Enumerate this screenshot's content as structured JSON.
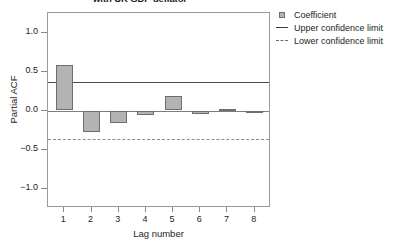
{
  "chart_data": {
    "type": "bar",
    "title": "with UK GDP deflator",
    "xlabel": "Lag number",
    "ylabel": "Partial ACF",
    "categories": [
      "1",
      "2",
      "3",
      "4",
      "5",
      "6",
      "7",
      "8"
    ],
    "values": [
      0.58,
      -0.27,
      -0.16,
      -0.06,
      0.18,
      -0.04,
      0.02,
      -0.01
    ],
    "series": [
      {
        "name": "Coefficient",
        "values": [
          0.58,
          -0.27,
          -0.16,
          -0.06,
          0.18,
          -0.04,
          0.02,
          -0.01
        ]
      }
    ],
    "ylim": [
      -1.25,
      1.25
    ],
    "yticks": [
      1.0,
      0.5,
      0.0,
      -0.5,
      -1.0
    ],
    "ytick_labels": [
      "1.0",
      "0.5",
      "0.0",
      "−0.5",
      "−1.0"
    ],
    "xlim": [
      0.4,
      8.6
    ],
    "upper_confidence_limit": 0.37,
    "lower_confidence_limit": -0.37,
    "grid": false,
    "legend_position": "top-right",
    "colors": {
      "bar_fill": "#b3b3b3",
      "bar_stroke": "#6e6e6e",
      "upper_limit_line": "#4a4a4a",
      "lower_limit_line": "#8b8b8b",
      "zero_line": "#7d7d7d",
      "axis": "#9a9a9a",
      "text": "#1d1d1d",
      "background": "#ffffff"
    }
  },
  "legend": {
    "items": [
      {
        "label": "Coefficient",
        "key": "swatch"
      },
      {
        "label": "Upper confidence limit",
        "key": "solid-line"
      },
      {
        "label": "Lower confidence limit",
        "key": "dashed-line"
      }
    ]
  }
}
